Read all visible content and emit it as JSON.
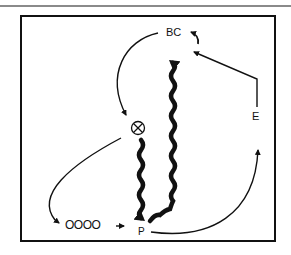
{
  "diagram": {
    "nodes": {
      "bc": {
        "label": "BC"
      },
      "x": {
        "label": "⊗",
        "icon": "crossed-circle-icon"
      },
      "e": {
        "label": "E"
      },
      "p": {
        "label": "P"
      },
      "circles": {
        "label": "OOOO",
        "count": 4
      }
    },
    "edges": [
      {
        "from": "BC",
        "to": "⊗",
        "style": "thin-curved-arrow"
      },
      {
        "from": "⊗",
        "to": "OOOO",
        "style": "thin-curved-arrow"
      },
      {
        "from": "OOOO",
        "to": "P",
        "style": "thin-short-arrow"
      },
      {
        "from": "⊗",
        "to": "P",
        "style": "thick-wavy-arrow"
      },
      {
        "from": "P",
        "to": "BC",
        "style": "thick-wavy-arrow"
      },
      {
        "from": "P",
        "to": "E",
        "style": "thin-curved-arrow"
      },
      {
        "from": "E",
        "to": "BC",
        "style": "thin-angled-arrow"
      },
      {
        "from": "BC",
        "to": "BC",
        "style": "thin-small-curl-arrow"
      }
    ],
    "colors": {
      "ink": "#111111",
      "rule": "#8a8a8a",
      "background": "#ffffff"
    }
  }
}
